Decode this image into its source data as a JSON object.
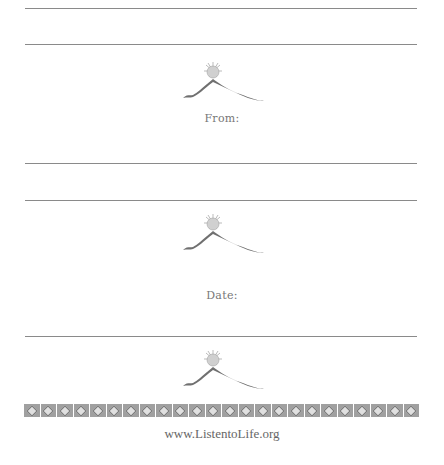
{
  "labels": {
    "from": "From:",
    "date": "Date:"
  },
  "footer": {
    "url": "www.ListentoLife.org"
  },
  "logo": {
    "icon": "sun-over-mountain-icon",
    "count": 3
  },
  "border": {
    "tiles": 24
  },
  "colors": {
    "rule": "#8a8a8a",
    "text": "#777777",
    "mountain": "#707070",
    "sun": "#d0d0d0"
  }
}
